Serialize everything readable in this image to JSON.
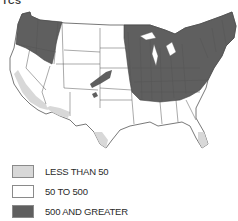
{
  "caption_fragment": "TCS",
  "map": {
    "type": "choropleth",
    "region": "Contiguous United States",
    "colors": {
      "low": "#d8d8d8",
      "mid": "#ffffff",
      "high": "#5f5f5f",
      "border": "#555555"
    }
  },
  "legend": {
    "items": [
      {
        "label": "LESS THAN 50",
        "color": "#d8d8d8"
      },
      {
        "label": "50 TO 500",
        "color": "#ffffff"
      },
      {
        "label": "500 AND GREATER",
        "color": "#5f5f5f"
      }
    ]
  }
}
